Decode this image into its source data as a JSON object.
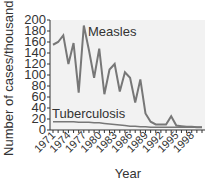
{
  "chart_data": {
    "type": "line",
    "title": "",
    "xlabel": "Year",
    "ylabel": "Number of cases/thousands",
    "ylim": [
      0,
      200
    ],
    "yticks": [
      0,
      20,
      40,
      60,
      80,
      100,
      120,
      140,
      160,
      180,
      200
    ],
    "xtick_labels": [
      "1971",
      "1974",
      "1977",
      "1980",
      "1983",
      "1986",
      "1989",
      "1992",
      "1995",
      "1998"
    ],
    "x": [
      1971,
      1972,
      1973,
      1974,
      1975,
      1976,
      1977,
      1978,
      1979,
      1980,
      1981,
      1982,
      1983,
      1984,
      1985,
      1986,
      1987,
      1988,
      1989,
      1990,
      1991,
      1992,
      1993,
      1994,
      1995,
      1996,
      1997,
      1998,
      1999,
      2000
    ],
    "series": [
      {
        "name": "Measles",
        "values": [
          155,
          160,
          172,
          120,
          158,
          68,
          190,
          145,
          95,
          148,
          65,
          110,
          120,
          70,
          105,
          95,
          50,
          92,
          30,
          15,
          10,
          10,
          10,
          25,
          8,
          7,
          6,
          6,
          5,
          5
        ]
      },
      {
        "name": "Tuberculosis",
        "values": [
          15,
          15,
          15,
          15,
          15,
          14,
          14,
          14,
          13,
          13,
          12,
          11,
          10,
          9,
          8,
          7,
          7,
          6,
          6,
          5,
          5,
          5,
          5,
          5,
          5,
          5,
          5,
          5,
          5,
          5
        ]
      }
    ],
    "annotations": [
      "Measles",
      "Tuberculosis"
    ],
    "grid": false
  }
}
